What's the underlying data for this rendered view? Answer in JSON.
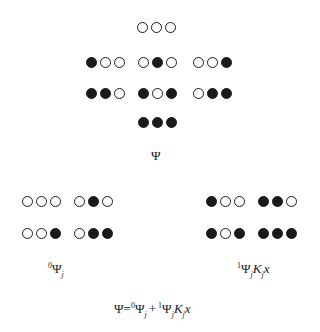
{
  "diagram": {
    "legend": {
      "open": "open-circle (state 0)",
      "filled": "filled-circle (state 1)"
    },
    "full_space": {
      "label": "Ψ",
      "triplets": [
        {
          "id": "t-000",
          "pattern": [
            0,
            0,
            0
          ],
          "x": 137,
          "y": 22
        },
        {
          "id": "t-100",
          "pattern": [
            1,
            0,
            0
          ],
          "x": 86,
          "y": 57
        },
        {
          "id": "t-010",
          "pattern": [
            0,
            1,
            0
          ],
          "x": 138,
          "y": 57
        },
        {
          "id": "t-001",
          "pattern": [
            0,
            0,
            1
          ],
          "x": 193,
          "y": 57
        },
        {
          "id": "t-110",
          "pattern": [
            1,
            1,
            0
          ],
          "x": 86,
          "y": 88
        },
        {
          "id": "t-101",
          "pattern": [
            1,
            0,
            1
          ],
          "x": 138,
          "y": 88
        },
        {
          "id": "t-011",
          "pattern": [
            0,
            1,
            1
          ],
          "x": 193,
          "y": 88
        },
        {
          "id": "t-111",
          "pattern": [
            1,
            1,
            1
          ],
          "x": 138,
          "y": 117
        }
      ]
    },
    "subspace_0": {
      "label_sup": "0",
      "label_main": "Ψ",
      "label_sub": "j",
      "triplets": [
        {
          "id": "s0-000",
          "pattern": [
            0,
            0,
            0
          ],
          "x": 22,
          "y": 196
        },
        {
          "id": "s0-010",
          "pattern": [
            0,
            1,
            0
          ],
          "x": 74,
          "y": 196
        },
        {
          "id": "s0-001",
          "pattern": [
            0,
            0,
            1
          ],
          "x": 22,
          "y": 228
        },
        {
          "id": "s0-011",
          "pattern": [
            0,
            1,
            1
          ],
          "x": 74,
          "y": 228
        }
      ]
    },
    "subspace_1": {
      "label_sup": "1",
      "label_main": "Ψ",
      "label_sub": "j",
      "label_K": "K",
      "label_K_sub": "j",
      "label_x": "x",
      "triplets": [
        {
          "id": "s1-100",
          "pattern": [
            1,
            0,
            0
          ],
          "x": 206,
          "y": 196
        },
        {
          "id": "s1-110",
          "pattern": [
            1,
            1,
            0
          ],
          "x": 258,
          "y": 196
        },
        {
          "id": "s1-101",
          "pattern": [
            1,
            0,
            1
          ],
          "x": 206,
          "y": 228
        },
        {
          "id": "s1-111",
          "pattern": [
            1,
            1,
            1
          ],
          "x": 258,
          "y": 228
        }
      ]
    },
    "equation": {
      "lhs": "Ψ",
      "eq": "=",
      "t1_sup": "0",
      "t1_main": "Ψ",
      "t1_sub": "j",
      "plus": "+",
      "t2_sup": "1",
      "t2_main": "Ψ",
      "t2_sub": "j",
      "t2_K": "K",
      "t2_K_sub": "j",
      "t2_x": "x"
    }
  }
}
